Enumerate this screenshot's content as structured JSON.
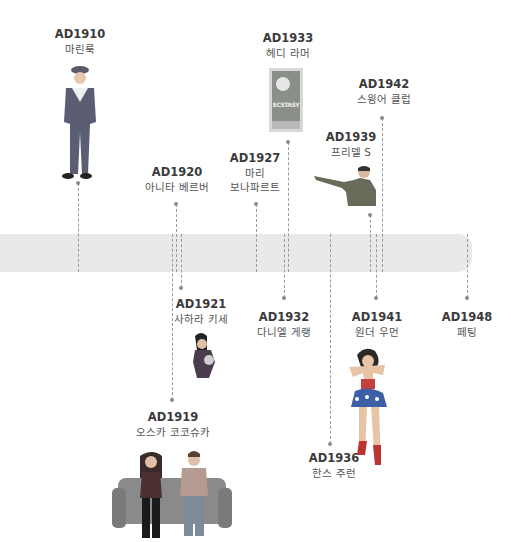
{
  "timeline": {
    "band_color": "#e9e9e9",
    "line_color": "#9a9a9a",
    "events": [
      {
        "year": "AD1910",
        "name": "마린룩",
        "illustration": "sailor-outfit-figure"
      },
      {
        "year": "AD1920",
        "name": "아니타 베르버",
        "illustration": ""
      },
      {
        "year": "AD1927",
        "name_lines": [
          "마리",
          "보나파르트"
        ]
      },
      {
        "year": "AD1933",
        "name": "헤디 라머",
        "illustration": "ecstasy-movie-poster"
      },
      {
        "year": "AD1942",
        "name": "스윙어 클럽"
      },
      {
        "year": "AD1939",
        "name": "프리델 S",
        "illustration": "saluting-man-figure"
      },
      {
        "year": "AD1921",
        "name": "사하라 키세",
        "illustration": "woman-figure"
      },
      {
        "year": "AD1932",
        "name": "다니엘 게랭"
      },
      {
        "year": "AD1941",
        "name": "원더 우먼",
        "illustration": "wonder-woman-figure"
      },
      {
        "year": "AD1948",
        "name": "페팅"
      },
      {
        "year": "AD1936",
        "name": "한스 주런"
      },
      {
        "year": "AD1919",
        "name": "오스카 코코슈카",
        "illustration": "couple-on-sofa"
      }
    ],
    "poster_text": "ECSTASY"
  }
}
